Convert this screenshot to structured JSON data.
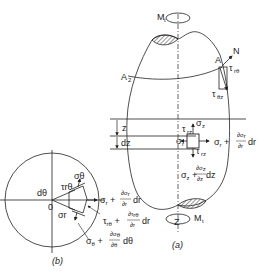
{
  "figure": {
    "part_a": {
      "caption": "(a)",
      "labels": {
        "moment_top": "M",
        "moment_top_sub": "t",
        "moment_bottom": "M",
        "moment_bottom_sub": "t",
        "axis": "Z",
        "point_a": "A",
        "point_a2": "A",
        "point_a2_sub": "2",
        "normal": "N",
        "tau_rtheta": "τ",
        "tau_rtheta_sub": "rθ",
        "tau_thetaz": "τ",
        "tau_thetaz_sub": "θz",
        "z": "z",
        "dz": "dz",
        "sigma_z": "σ",
        "sigma_z_sub": "z",
        "tau_rz_top": "τ",
        "tau_rz_top_sub": "rz",
        "tau_rz_bottom": "τ",
        "tau_rz_bottom_sub": "rz",
        "sigma_r": "σ",
        "sigma_r_sub": "r",
        "sigma_r_plus": "σr + ∂σr/∂r dr",
        "sigma_z_plus": "σz + ∂σz/∂z dz"
      }
    },
    "part_b": {
      "caption": "(b)",
      "labels": {
        "origin": "0",
        "dtheta": "dθ",
        "sigma_theta": "σθ",
        "tau_rtheta": "τrθ",
        "sigma_r": "σr",
        "sigma_r_plus": "σr + ∂σr/∂r dr",
        "tau_rtheta_plus": "τrθ + ∂τrθ/∂r dr",
        "sigma_theta_plus": "σθ + ∂σθ/∂θ dθ"
      }
    }
  }
}
